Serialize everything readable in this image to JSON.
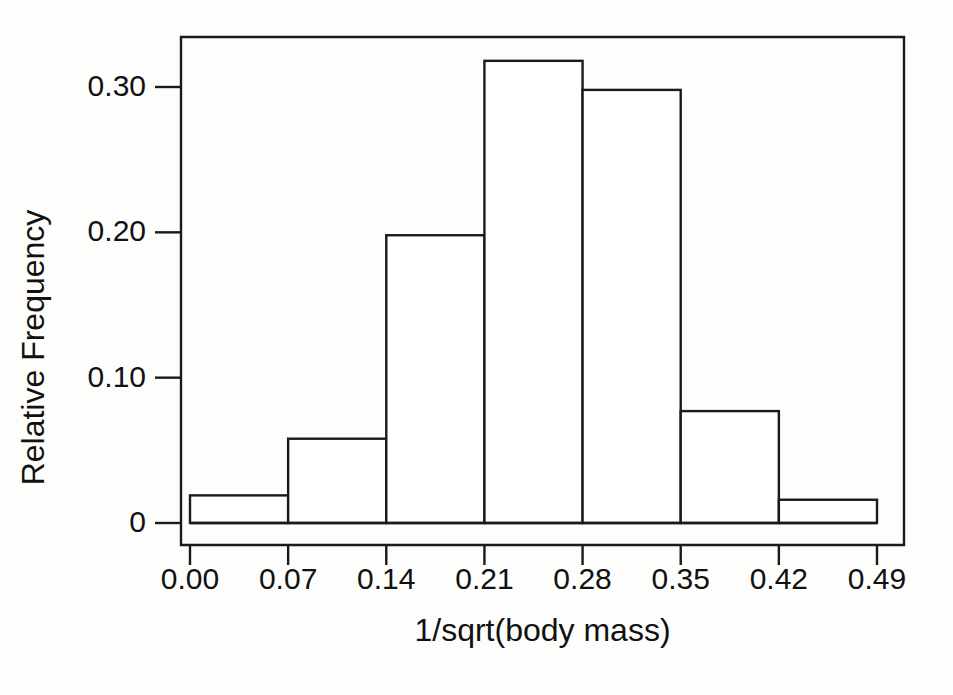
{
  "chart_data": {
    "type": "bar",
    "title": "",
    "subtitle": "",
    "xlabel": "1/sqrt(body mass)",
    "ylabel": "Relative Frequency",
    "grid": false,
    "legend": null,
    "legend_position": "none",
    "bin_edges": [
      0.0,
      0.07,
      0.14,
      0.21,
      0.28,
      0.35,
      0.42,
      0.49
    ],
    "categories": [
      "0.00-0.07",
      "0.07-0.14",
      "0.14-0.21",
      "0.21-0.28",
      "0.28-0.35",
      "0.35-0.42",
      "0.42-0.49"
    ],
    "values": [
      0.019,
      0.058,
      0.198,
      0.318,
      0.298,
      0.077,
      0.016
    ],
    "xlim": [
      0.0,
      0.49
    ],
    "ylim": [
      0.0,
      0.33
    ],
    "x_ticks": [
      0.0,
      0.07,
      0.14,
      0.21,
      0.28,
      0.35,
      0.42,
      0.49
    ],
    "x_tick_labels": [
      "0.00",
      "0.07",
      "0.14",
      "0.21",
      "0.28",
      "0.35",
      "0.42",
      "0.49"
    ],
    "y_ticks": [
      0.0,
      0.1,
      0.2,
      0.3
    ],
    "y_tick_labels": [
      "0",
      "0.10",
      "0.20",
      "0.30"
    ],
    "bar_color": "#ffffff",
    "bar_edge_color": "#1a1a1a",
    "background_color": "#ffffff"
  },
  "axes": {
    "y_title": "Relative Frequency",
    "x_title": "1/sqrt(body mass)"
  }
}
